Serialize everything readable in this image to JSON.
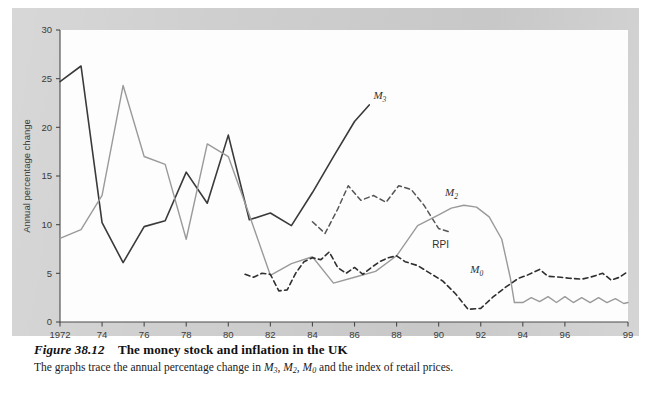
{
  "figure": {
    "number": "Figure 38.12",
    "title": "The money stock and inflation in the UK",
    "description_prefix": "The graphs trace the annual percentage change in ",
    "description_suffix": " and the index of retail prices.",
    "description_series": [
      "M3",
      "M2",
      "M0"
    ],
    "background_color": "#cfcfcf",
    "canvas_color": "#fdfdfd"
  },
  "chart_data": {
    "type": "line",
    "title": "The money stock and inflation in the UK",
    "xlabel": "",
    "ylabel": "Annual percentage change",
    "xlim": [
      1972,
      1999
    ],
    "ylim": [
      0,
      30
    ],
    "yticks": [
      0,
      5,
      10,
      15,
      20,
      25,
      30
    ],
    "ytick_labels": [
      "0",
      "5",
      "10",
      "15",
      "20",
      "25",
      "30"
    ],
    "xticks": [
      1972,
      1974,
      1976,
      1978,
      1980,
      1982,
      1984,
      1986,
      1988,
      1990,
      1992,
      1994,
      1996,
      1999
    ],
    "xtick_labels": [
      "1972",
      "74",
      "76",
      "78",
      "80",
      "82",
      "84",
      "86",
      "88",
      "90",
      "92",
      "94",
      "96",
      "99"
    ],
    "grid": false,
    "legend_position": "inline-annotations",
    "series": [
      {
        "name": "M3",
        "label": "M3",
        "style": "solid",
        "color": "#3a3a3a",
        "width": 1.6,
        "label_x": 1986.9,
        "label_y": 22.9,
        "x": [
          1972,
          1973,
          1974,
          1975,
          1976,
          1977,
          1978,
          1979,
          1980,
          1981,
          1982,
          1983,
          1984,
          1985,
          1986,
          1986.7
        ],
        "values": [
          24.7,
          26.3,
          10.2,
          6.1,
          9.8,
          10.4,
          15.4,
          12.2,
          19.2,
          10.5,
          11.2,
          9.9,
          13.3,
          17.0,
          20.6,
          22.3
        ]
      },
      {
        "name": "M2",
        "label": "M2",
        "style": "dashed",
        "color": "#555555",
        "width": 1.5,
        "dash": "5,3.5",
        "label_x": 1990.3,
        "label_y": 12.9,
        "x": [
          1984.0,
          1984.6,
          1985.2,
          1985.7,
          1986.3,
          1986.9,
          1987.5,
          1988.1,
          1988.7,
          1989.3,
          1990.0,
          1990.6
        ],
        "values": [
          10.3,
          9.1,
          11.6,
          14.0,
          12.5,
          13.0,
          12.3,
          14.0,
          13.6,
          12.0,
          9.6,
          9.2
        ]
      },
      {
        "name": "RPI",
        "label": "RPI",
        "style": "solid",
        "color": "#9a9a9a",
        "width": 1.4,
        "label_x": 1989.7,
        "label_y": 7.6,
        "x": [
          1972,
          1973,
          1974,
          1975,
          1976,
          1977,
          1978,
          1979,
          1980,
          1981,
          1982,
          1983,
          1984,
          1985,
          1986,
          1987,
          1988,
          1989,
          1990,
          1990.6,
          1991.2,
          1991.8,
          1992.4,
          1993.0,
          1993.4,
          1993.6,
          1994,
          1994.4,
          1994.8,
          1995.2,
          1995.6,
          1996,
          1996.4,
          1996.8,
          1997.2,
          1997.6,
          1998,
          1998.4,
          1998.8,
          1999
        ],
        "values": [
          8.6,
          9.5,
          13.0,
          24.3,
          17.0,
          16.2,
          8.5,
          18.3,
          17.0,
          11.0,
          4.8,
          6.0,
          6.7,
          4.0,
          4.6,
          5.2,
          6.8,
          9.9,
          11.0,
          11.7,
          12.0,
          11.8,
          10.8,
          8.5,
          4.6,
          2.0,
          2.0,
          2.5,
          2.1,
          2.6,
          2.0,
          2.6,
          2.0,
          2.5,
          2.0,
          2.5,
          2.0,
          2.4,
          1.9,
          2.0
        ]
      },
      {
        "name": "M0",
        "label": "M0",
        "style": "dashed",
        "color": "#2f2f2f",
        "width": 1.6,
        "dash": "5,3.5",
        "label_x": 1991.5,
        "label_y": 5.0,
        "x": [
          1980.8,
          1981.2,
          1981.6,
          1982.0,
          1982.4,
          1982.8,
          1983.2,
          1983.6,
          1984.0,
          1984.4,
          1984.8,
          1985.2,
          1985.6,
          1986.0,
          1986.4,
          1986.8,
          1987.2,
          1987.6,
          1988.0,
          1988.4,
          1989.0,
          1989.6,
          1990.2,
          1990.8,
          1991.4,
          1992.0,
          1992.6,
          1993.2,
          1993.8,
          1994.2,
          1994.8,
          1995.2,
          1995.8,
          1996.2,
          1996.8,
          1997.2,
          1997.8,
          1998.2,
          1998.6,
          1999
        ],
        "values": [
          4.9,
          4.6,
          5.0,
          4.9,
          3.2,
          3.3,
          5.0,
          6.2,
          6.6,
          6.4,
          7.2,
          5.6,
          5.0,
          5.6,
          4.9,
          5.6,
          6.2,
          6.6,
          6.8,
          6.2,
          5.8,
          5.0,
          4.2,
          2.9,
          1.3,
          1.4,
          2.6,
          3.6,
          4.5,
          4.8,
          5.4,
          4.7,
          4.6,
          4.5,
          4.4,
          4.6,
          5.0,
          4.3,
          4.6,
          5.2
        ]
      }
    ]
  }
}
